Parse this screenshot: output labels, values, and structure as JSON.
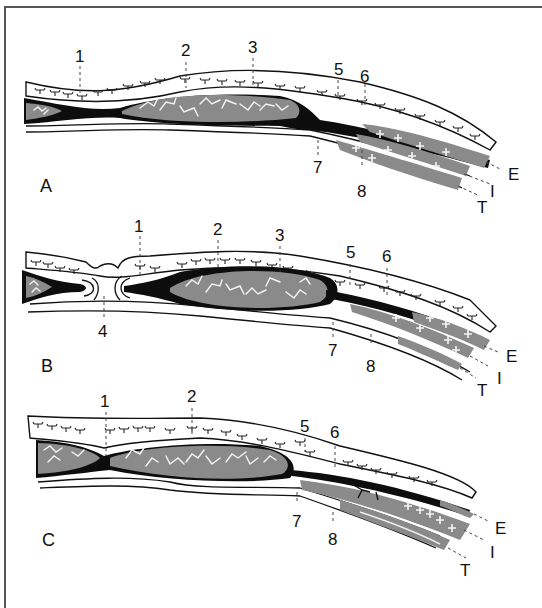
{
  "figure": {
    "type": "anatomical-schematic",
    "panels": [
      {
        "id": "A",
        "label": "A",
        "numbered_markers": [
          "1",
          "2",
          "3",
          "5",
          "6",
          "7",
          "8"
        ],
        "layer_labels": [
          "E",
          "I",
          "T"
        ]
      },
      {
        "id": "B",
        "label": "B",
        "numbered_markers": [
          "1",
          "2",
          "3",
          "4",
          "5",
          "6",
          "7",
          "8"
        ],
        "layer_labels": [
          "E",
          "I",
          "T"
        ]
      },
      {
        "id": "C",
        "label": "C",
        "numbered_markers": [
          "1",
          "2",
          "5",
          "6",
          "7",
          "8"
        ],
        "layer_labels": [
          "E",
          "I",
          "T"
        ]
      }
    ]
  },
  "panelA": {
    "label": "A",
    "m1": "1",
    "m2": "2",
    "m3": "3",
    "m5": "5",
    "m6": "6",
    "m7": "7",
    "m8": "8",
    "E": "E",
    "I": "I",
    "T": "T"
  },
  "panelB": {
    "label": "B",
    "m1": "1",
    "m2": "2",
    "m3": "3",
    "m4": "4",
    "m5": "5",
    "m6": "6",
    "m7": "7",
    "m8": "8",
    "E": "E",
    "I": "I",
    "T": "T"
  },
  "panelC": {
    "label": "C",
    "m1": "1",
    "m2": "2",
    "m5": "5",
    "m6": "6",
    "m7": "7",
    "m8": "8",
    "E": "E",
    "I": "I",
    "T": "T"
  },
  "colors": {
    "ink": "#0d0d0d",
    "tissue_grey": "#8a8a8a",
    "background": "#ffffff",
    "frame": "#555555"
  }
}
